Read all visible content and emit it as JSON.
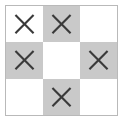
{
  "figure": {
    "name": "tic-tac-toe-pattern-grid",
    "rows": 3,
    "columns": 3,
    "colors": {
      "background": "#ffffff",
      "cell_white": "#ffffff",
      "cell_shaded": "#c9c9c9",
      "mark_stroke": "#3a3a3a",
      "frame_border": "#b9b9b9"
    },
    "cells": [
      {
        "id": "cell-r1c1",
        "row": 1,
        "col": 1,
        "shaded": false,
        "mark": "x-mark",
        "mark_present": true
      },
      {
        "id": "cell-r1c2",
        "row": 1,
        "col": 2,
        "shaded": true,
        "mark": "x-mark",
        "mark_present": true
      },
      {
        "id": "cell-r1c3",
        "row": 1,
        "col": 3,
        "shaded": false,
        "mark": "none",
        "mark_present": false
      },
      {
        "id": "cell-r2c1",
        "row": 2,
        "col": 1,
        "shaded": true,
        "mark": "x-mark",
        "mark_present": true
      },
      {
        "id": "cell-r2c2",
        "row": 2,
        "col": 2,
        "shaded": false,
        "mark": "none",
        "mark_present": false
      },
      {
        "id": "cell-r2c3",
        "row": 2,
        "col": 3,
        "shaded": true,
        "mark": "x-mark",
        "mark_present": true
      },
      {
        "id": "cell-r3c1",
        "row": 3,
        "col": 1,
        "shaded": false,
        "mark": "none",
        "mark_present": false
      },
      {
        "id": "cell-r3c2",
        "row": 3,
        "col": 2,
        "shaded": true,
        "mark": "x-mark",
        "mark_present": true
      },
      {
        "id": "cell-r3c3",
        "row": 3,
        "col": 3,
        "shaded": false,
        "mark": "none",
        "mark_present": false
      }
    ]
  }
}
